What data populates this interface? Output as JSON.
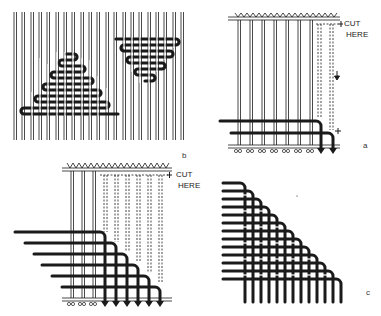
{
  "figure": {
    "panels": [
      {
        "id": "a",
        "label": "a",
        "description": "Loom warp with top weft cut; warps drawn down and knotted at bottom",
        "annotation": "CUT HERE"
      },
      {
        "id": "b",
        "label": "b",
        "description": "Two woven triangles (upright and inverted) on a warp"
      },
      {
        "id": "c",
        "label": "c",
        "description": "Completed woven triangle with warp and weft ends"
      }
    ],
    "cut_label_a_line1": "CUT",
    "cut_label_a_line2": "HERE",
    "cut_label_b_line1": "CUT",
    "cut_label_b_line2": "HERE",
    "panel_letter_a": "a",
    "panel_letter_b": "b",
    "panel_letter_c": "c"
  },
  "colors": {
    "ink": "#1a1a1a",
    "paper": "#ffffff"
  }
}
